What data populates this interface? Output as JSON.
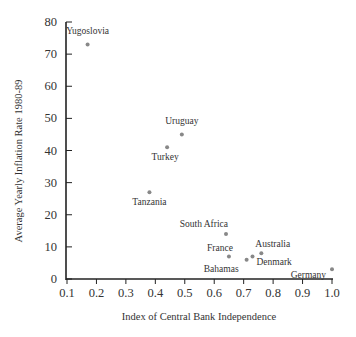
{
  "chart_data": {
    "type": "scatter",
    "title": "",
    "xlabel": "Index of Central Bank Independence",
    "ylabel": "Average Yearly Inflation Rate 1980-89",
    "xlim": [
      0.1,
      1.0
    ],
    "ylim": [
      0,
      80
    ],
    "xticks": [
      "0.1",
      "0.2",
      "0.3",
      "0.4",
      "0.5",
      "0.6",
      "0.7",
      "0.8",
      "0.9",
      "1.0"
    ],
    "yticks": [
      "0",
      "10",
      "20",
      "30",
      "40",
      "50",
      "60",
      "70",
      "80"
    ],
    "grid": false,
    "legend": null,
    "point_color": "#888888",
    "axis_color": "#222222",
    "points": [
      {
        "label": "Yugoslovia",
        "x": 0.17,
        "y": 73
      },
      {
        "label": "Uruguay",
        "x": 0.49,
        "y": 45
      },
      {
        "label": "Turkey",
        "x": 0.44,
        "y": 41
      },
      {
        "label": "Tanzania",
        "x": 0.38,
        "y": 27
      },
      {
        "label": "South Africa",
        "x": 0.64,
        "y": 14
      },
      {
        "label": "France",
        "x": 0.65,
        "y": 7
      },
      {
        "label": "Bahamas",
        "x": 0.71,
        "y": 6
      },
      {
        "label": "Denmark",
        "x": 0.73,
        "y": 7
      },
      {
        "label": "Australia",
        "x": 0.76,
        "y": 8
      },
      {
        "label": "Germany",
        "x": 1.0,
        "y": 3
      }
    ]
  }
}
